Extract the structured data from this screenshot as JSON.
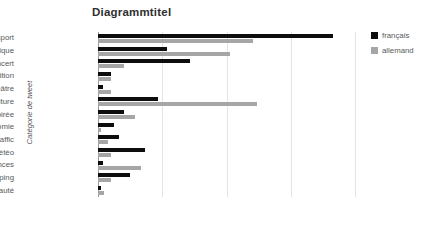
{
  "chart_data": {
    "type": "bar",
    "orientation": "horizontal",
    "title": "Diagrammtitel",
    "xlabel": "",
    "ylabel": "Catégorie de tweet",
    "grid": true,
    "legend_position": "top-right",
    "xlim": [
      0,
      40
    ],
    "xticks": [
      0,
      10,
      20,
      30,
      40
    ],
    "xtick_labels": [
      "0%",
      "10%",
      "20%",
      "30%",
      "40%"
    ],
    "categories": [
      "sport",
      "politique",
      "concert",
      "exposition",
      "théâtre",
      "autre culture",
      "soirée",
      "gastronomie",
      "traffic",
      "météo",
      "petites annonces",
      "shopping",
      "beauté"
    ],
    "series": [
      {
        "name": "français",
        "color": "#0d0d0d",
        "values": [
          36.5,
          10.8,
          14.3,
          2.0,
          0.8,
          9.3,
          4.0,
          2.5,
          3.3,
          7.3,
          0.8,
          5.0,
          0.5
        ]
      },
      {
        "name": "allemand",
        "color": "#a6a6a6",
        "values": [
          24.2,
          20.5,
          4.0,
          2.0,
          2.0,
          24.8,
          5.8,
          0.5,
          1.5,
          2.0,
          6.7,
          2.0,
          1.0
        ]
      }
    ]
  }
}
